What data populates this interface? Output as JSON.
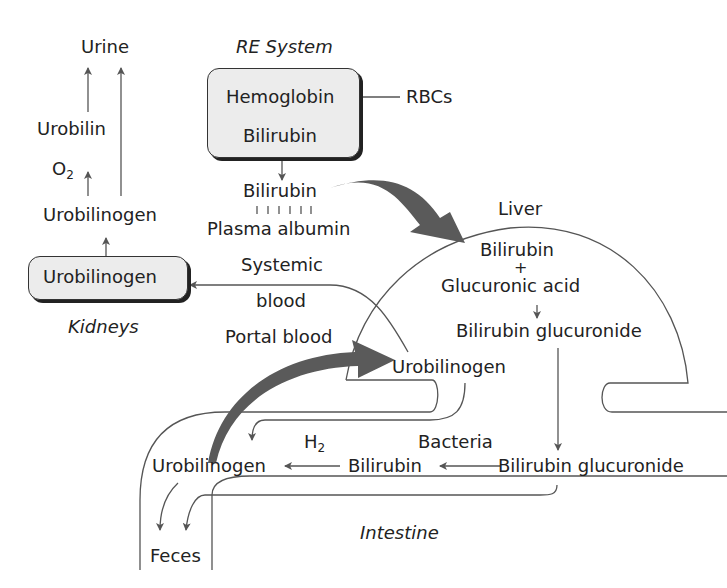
{
  "diagram": {
    "title_re_system": "RE System",
    "re_box": {
      "top": "Hemoglobin",
      "bottom": "Bilirubin"
    },
    "rbcs": "RBCs",
    "bilirubin_plasma": "Bilirubin",
    "plasma_albumin": "Plasma albumin",
    "systemic": "Systemic",
    "blood": "blood",
    "portal_blood": "Portal blood",
    "urine": "Urine",
    "urobilin": "Urobilin",
    "o2": "O",
    "o2_sub": "2",
    "urobilinogen_upper": "Urobilinogen",
    "kidney_box": "Urobilinogen",
    "kidneys": "Kidneys",
    "liver": "Liver",
    "liver_bilirubin": "Bilirubin",
    "plus": "+",
    "glucuronic_acid": "Glucuronic acid",
    "liver_glucuronide": "Bilirubin glucuronide",
    "liver_urobilinogen": "Urobilinogen",
    "h2": "H",
    "h2_sub": "2",
    "bacteria": "Bacteria",
    "int_urobilinogen": "Urobilinogen",
    "int_bilirubin": "Bilirubin",
    "int_glucuronide": "Bilirubin glucuronide",
    "intestine": "Intestine",
    "feces": "Feces"
  },
  "colors": {
    "line": "#555555",
    "big_arrow": "#5a5a5a",
    "box_fill": "#ececec"
  }
}
